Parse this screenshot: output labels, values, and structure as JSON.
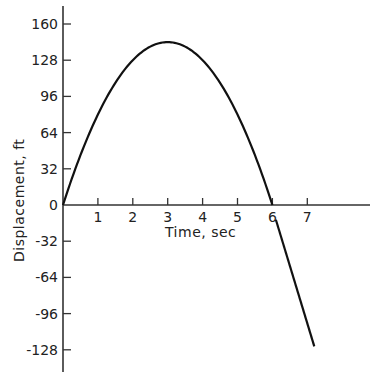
{
  "chart_data": {
    "type": "line",
    "title": "",
    "xlabel": "Time, sec",
    "ylabel": "Displacement, ft",
    "xlim": [
      0,
      8
    ],
    "ylim": [
      -140,
      170
    ],
    "grid": false,
    "legend": null,
    "x_ticks": [
      1,
      2,
      3,
      4,
      5,
      6,
      7
    ],
    "x_tick_labels": [
      "1",
      "2",
      "3",
      "4",
      "5",
      "6",
      "7"
    ],
    "y_ticks": [
      160,
      128,
      96,
      64,
      32,
      0,
      -32,
      -64,
      -96,
      -128
    ],
    "y_tick_labels": [
      "160",
      "128",
      "96",
      "64",
      "32",
      "0",
      "-32",
      "-64",
      "-96",
      "-128"
    ],
    "series": [
      {
        "name": "displacement (parabola, s = 96t - 16t^2)",
        "x": [
          0,
          0.5,
          1,
          1.5,
          2,
          2.5,
          3,
          3.5,
          4,
          4.5,
          5,
          5.5,
          6
        ],
        "values": [
          0,
          44,
          80,
          108,
          128,
          140,
          144,
          140,
          128,
          108,
          80,
          44,
          0
        ]
      },
      {
        "name": "displacement after t = 6 (linear)",
        "x": [
          6.1,
          7.2
        ],
        "values": [
          -13,
          -125
        ]
      }
    ],
    "annotations": []
  },
  "colors": {
    "line": "#111111",
    "axis": "#333333",
    "background": "#ffffff"
  }
}
